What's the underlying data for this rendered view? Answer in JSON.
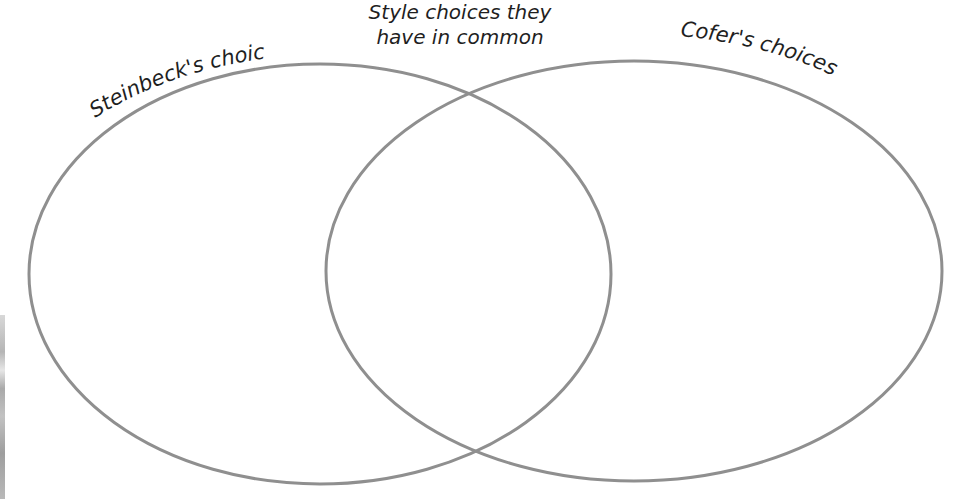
{
  "diagram": {
    "type": "venn",
    "colors": {
      "outline": "#8f8f8f",
      "text": "#1f1f1f",
      "background": "#ffffff"
    },
    "sets": [
      {
        "id": "steinbeck",
        "label": "Steinbeck's choices",
        "items": []
      },
      {
        "id": "cofer",
        "label": "Cofer's choices",
        "items": []
      }
    ],
    "intersection": {
      "label_line1": "Style choices they",
      "label_line2": "have in common",
      "items": []
    }
  }
}
